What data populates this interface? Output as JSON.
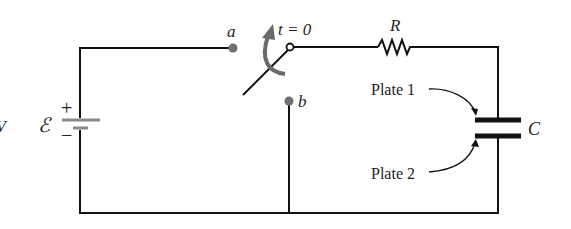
{
  "diagram": {
    "type": "RC circuit with switch",
    "labels": {
      "emf": "ℰ",
      "emf_fragment_left": "V",
      "plus": "+",
      "minus": "−",
      "point_a": "a",
      "point_b": "b",
      "switch_time": "t = 0",
      "resistor": "R",
      "capacitor": "C",
      "plate1": "Plate 1",
      "plate2": "Plate 2"
    },
    "components": [
      {
        "id": "battery",
        "label": "ℰ",
        "position": "left"
      },
      {
        "id": "switch",
        "label": "t = 0",
        "terminals": [
          "a",
          "b"
        ]
      },
      {
        "id": "resistor",
        "label": "R",
        "position": "top-right"
      },
      {
        "id": "capacitor",
        "label": "C",
        "plates": [
          "Plate 1",
          "Plate 2"
        ],
        "position": "right"
      }
    ],
    "colors": {
      "wire": "#111111",
      "terminal_dot": "#707070",
      "battery_plate": "#8a8a8a",
      "arrow": "#6a6a6a"
    }
  }
}
